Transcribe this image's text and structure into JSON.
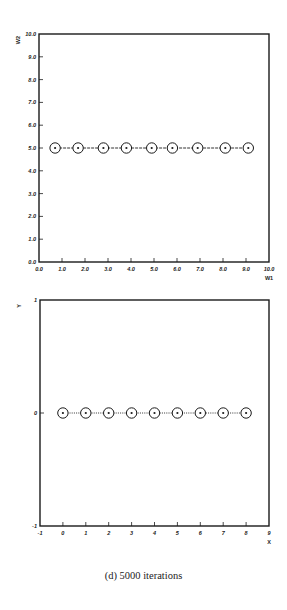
{
  "caption": "(d) 5000 iterations",
  "chart_data": [
    {
      "type": "scatter",
      "title": "",
      "xlabel": "W1",
      "ylabel": "W2",
      "xlim": [
        0.0,
        10.0
      ],
      "ylim": [
        0.0,
        10.0
      ],
      "xticks": [
        "0.0",
        "1.0",
        "2.0",
        "3.0",
        "4.0",
        "5.0",
        "6.0",
        "7.0",
        "8.0",
        "9.0",
        "10.0"
      ],
      "yticks": [
        "0.0",
        "1.0",
        "2.0",
        "3.0",
        "4.0",
        "5.0",
        "6.0",
        "7.0",
        "8.0",
        "9.0",
        "10.0"
      ],
      "grid": false,
      "connected": true,
      "marker": "circle",
      "x": [
        0.7,
        1.7,
        2.8,
        3.8,
        4.9,
        5.8,
        6.9,
        8.1,
        9.1
      ],
      "y": [
        5.0,
        5.0,
        5.0,
        5.0,
        5.0,
        5.0,
        5.0,
        5.0,
        5.0
      ]
    },
    {
      "type": "scatter",
      "title": "",
      "xlabel": "X",
      "ylabel": "Y",
      "xlim": [
        -1,
        9
      ],
      "ylim": [
        -1,
        1
      ],
      "xticks": [
        "-1",
        "0",
        "1",
        "2",
        "3",
        "4",
        "5",
        "6",
        "7",
        "8",
        "9"
      ],
      "yticks": [
        "-1",
        "0",
        "1"
      ],
      "grid": false,
      "connected": true,
      "marker": "circle",
      "x": [
        0,
        1,
        2,
        3,
        4,
        5,
        6,
        7,
        8
      ],
      "y": [
        0,
        0,
        0,
        0,
        0,
        0,
        0,
        0,
        0
      ]
    }
  ]
}
